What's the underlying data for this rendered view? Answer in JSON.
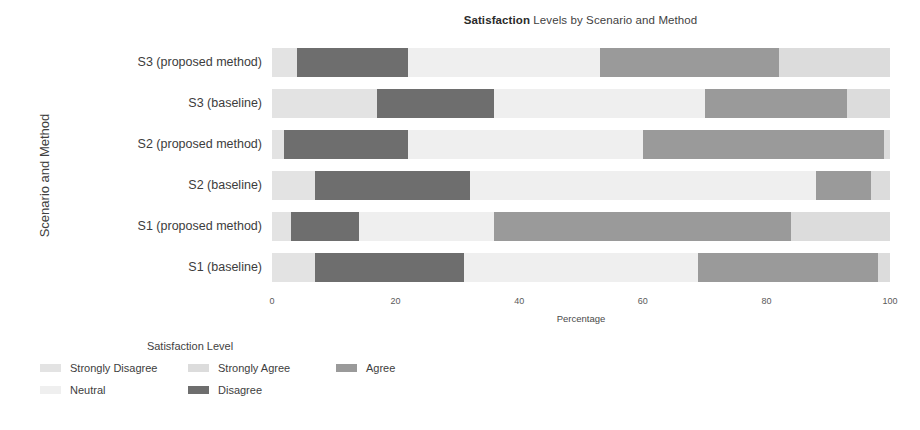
{
  "chart_data": {
    "type": "bar",
    "orientation": "horizontal",
    "stacked": true,
    "stacked_mode": "percent",
    "title": "Satisfaction Levels by Scenario and Method",
    "title_strong": "Satisfaction",
    "title_rest": " Levels by Scenario and Method",
    "xlabel": "Percentage",
    "ylabel": "Scenario and Method",
    "xlim": [
      0,
      100
    ],
    "xticks": [
      0,
      20,
      40,
      60,
      80,
      100
    ],
    "xticklabels": [
      "0",
      "20",
      "40",
      "60",
      "80",
      "100"
    ],
    "grid": false,
    "legend_title": "Satisfaction Level",
    "legend_position": "bottom-left",
    "categories": [
      "S1 (baseline)",
      "S1 (proposed method)",
      "S2 (baseline)",
      "S2 (proposed method)",
      "S3 (baseline)",
      "S3 (proposed method)"
    ],
    "categories_top_to_bottom": [
      "S3 (proposed method)",
      "S3 (baseline)",
      "S2 (proposed method)",
      "S2 (baseline)",
      "S1 (proposed method)",
      "S1 (baseline)"
    ],
    "series": [
      {
        "name": "Strongly Disagree",
        "color": "#e3e3e3",
        "values_top_to_bottom": [
          4,
          17,
          2,
          7,
          3,
          7
        ]
      },
      {
        "name": "Disagree",
        "color": "#6e6e6e",
        "values_top_to_bottom": [
          18,
          19,
          20,
          25,
          11,
          24
        ]
      },
      {
        "name": "Neutral",
        "color": "#efefef",
        "values_top_to_bottom": [
          31,
          34,
          38,
          56,
          22,
          38
        ]
      },
      {
        "name": "Agree",
        "color": "#9a9a9a",
        "values_top_to_bottom": [
          29,
          23,
          39,
          9,
          48,
          29
        ]
      },
      {
        "name": "Strongly Agree",
        "color": "#dcdcdc",
        "values_top_to_bottom": [
          18,
          7,
          1,
          3,
          16,
          2
        ]
      }
    ]
  },
  "legend": {
    "title": "Satisfaction Level",
    "items": [
      {
        "label": "Strongly Disagree",
        "color": "#e3e3e3"
      },
      {
        "label": "Disagree",
        "color": "#6e6e6e"
      },
      {
        "label": "Neutral",
        "color": "#efefef"
      },
      {
        "label": "Agree",
        "color": "#9a9a9a"
      },
      {
        "label": "Strongly Agree",
        "color": "#dcdcdc"
      }
    ]
  }
}
